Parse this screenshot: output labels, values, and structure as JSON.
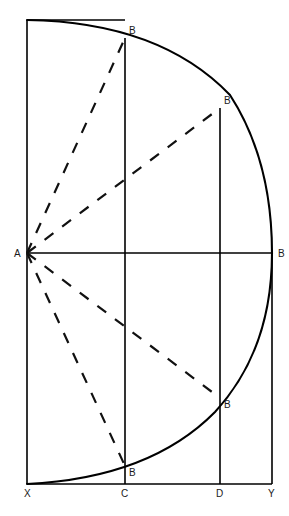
{
  "figure": {
    "type": "geometric-diagram",
    "canvas": {
      "width": 289,
      "height": 516
    },
    "colors": {
      "stroke": "#000000",
      "dash": "#111111",
      "label": "#1a1a1a",
      "background": "#ffffff"
    },
    "points": {
      "A": {
        "label": "A",
        "x": 27,
        "y": 253,
        "label_x": 14,
        "label_y": 257
      },
      "B_right": {
        "label": "B",
        "x": 272,
        "y": 253,
        "label_x": 278,
        "label_y": 257
      },
      "X": {
        "label": "X",
        "x": 27,
        "y": 484,
        "label_x": 24,
        "label_y": 497
      },
      "C": {
        "label": "C",
        "x": 125,
        "y": 484,
        "label_x": 121,
        "label_y": 497
      },
      "D": {
        "label": "D",
        "x": 220,
        "y": 484,
        "label_x": 216,
        "label_y": 497
      },
      "Y": {
        "label": "Y",
        "x": 272,
        "y": 484,
        "label_x": 268,
        "label_y": 497
      },
      "B_top_c": {
        "label": "B",
        "x": 125,
        "y": 38,
        "label_x": 129,
        "label_y": 34
      },
      "B_top_d": {
        "label": "B",
        "x": 220,
        "y": 108,
        "label_x": 224,
        "label_y": 104
      },
      "B_bottom_d": {
        "label": "B",
        "x": 220,
        "y": 398,
        "label_x": 224,
        "label_y": 408
      },
      "B_bottom_c": {
        "label": "B",
        "x": 125,
        "y": 466,
        "label_x": 129,
        "label_y": 476
      },
      "top_left": {
        "x": 27,
        "y": 20
      }
    },
    "lines": [
      {
        "name": "left-edge-XA-top",
        "x1": 27,
        "y1": 20,
        "x2": 27,
        "y2": 484
      },
      {
        "name": "baseline-XY",
        "x1": 27,
        "y1": 484,
        "x2": 272,
        "y2": 484
      },
      {
        "name": "horizontal-AB",
        "x1": 27,
        "y1": 253,
        "x2": 272,
        "y2": 253
      },
      {
        "name": "vertical-C",
        "x1": 125,
        "y1": 38,
        "x2": 125,
        "y2": 484
      },
      {
        "name": "vertical-D",
        "x1": 220,
        "y1": 108,
        "x2": 220,
        "y2": 484
      },
      {
        "name": "vertical-Y",
        "x1": 272,
        "y1": 253,
        "x2": 272,
        "y2": 484
      },
      {
        "name": "top-edge-segment",
        "x1": 27,
        "y1": 20,
        "x2": 125,
        "y2": 20
      }
    ],
    "arc": {
      "name": "semicircle-arc",
      "description": "Arc from top-left corner through right point B down to X",
      "path": "M 27 20 Q 160 22 230 95 Q 272 160 272 253 Q 272 350 215 412 Q 150 478 27 484"
    },
    "dashed_rays": [
      {
        "name": "ray-A-to-B-top-c",
        "x1": 27,
        "y1": 253,
        "x2": 125,
        "y2": 38
      },
      {
        "name": "ray-A-to-B-top-d",
        "x1": 27,
        "y1": 253,
        "x2": 220,
        "y2": 108
      },
      {
        "name": "ray-A-to-B-bottom-d",
        "x1": 27,
        "y1": 253,
        "x2": 220,
        "y2": 398
      },
      {
        "name": "ray-A-to-B-bottom-c",
        "x1": 27,
        "y1": 253,
        "x2": 125,
        "y2": 466
      }
    ]
  }
}
